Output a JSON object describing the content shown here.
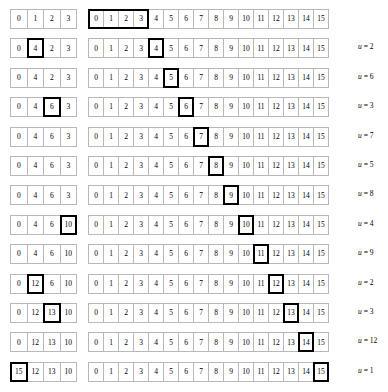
{
  "diagram": {
    "colors": {
      "cell_border": "#b8b8b8",
      "highlight_border": "#000000",
      "background": "#ffffff",
      "text": "#000000"
    },
    "big_array_values": [
      "0",
      "1",
      "2",
      "3",
      "4",
      "5",
      "6",
      "7",
      "8",
      "9",
      "10",
      "11",
      "12",
      "13",
      "14",
      "15"
    ],
    "label_prefix": "u",
    "label_separator": "=",
    "rows": [
      {
        "small_values": [
          "0",
          "1",
          "2",
          "3"
        ],
        "small_highlight": null,
        "small_group": null,
        "big_highlight": null,
        "big_group": [
          0,
          3
        ],
        "label": null
      },
      {
        "small_values": [
          "0",
          "4",
          "2",
          "3"
        ],
        "small_highlight": 1,
        "small_group": null,
        "big_highlight": 4,
        "big_group": null,
        "label": "2"
      },
      {
        "small_values": [
          "0",
          "4",
          "2",
          "3"
        ],
        "small_highlight": null,
        "small_group": null,
        "big_highlight": 5,
        "big_group": null,
        "label": "6"
      },
      {
        "small_values": [
          "0",
          "4",
          "6",
          "3"
        ],
        "small_highlight": 2,
        "small_group": null,
        "big_highlight": 6,
        "big_group": null,
        "label": "3"
      },
      {
        "small_values": [
          "0",
          "4",
          "6",
          "3"
        ],
        "small_highlight": null,
        "small_group": null,
        "big_highlight": 7,
        "big_group": null,
        "label": "7"
      },
      {
        "small_values": [
          "0",
          "4",
          "6",
          "3"
        ],
        "small_highlight": null,
        "small_group": null,
        "big_highlight": 8,
        "big_group": null,
        "label": "5"
      },
      {
        "small_values": [
          "0",
          "4",
          "6",
          "3"
        ],
        "small_highlight": null,
        "small_group": null,
        "big_highlight": 9,
        "big_group": null,
        "label": "8"
      },
      {
        "small_values": [
          "0",
          "4",
          "6",
          "10"
        ],
        "small_highlight": 3,
        "small_group": null,
        "big_highlight": 10,
        "big_group": null,
        "label": "4"
      },
      {
        "small_values": [
          "0",
          "4",
          "6",
          "10"
        ],
        "small_highlight": null,
        "small_group": null,
        "big_highlight": 11,
        "big_group": null,
        "label": "9"
      },
      {
        "small_values": [
          "0",
          "12",
          "6",
          "10"
        ],
        "small_highlight": 1,
        "small_group": null,
        "big_highlight": 12,
        "big_group": null,
        "label": "2"
      },
      {
        "small_values": [
          "0",
          "12",
          "13",
          "10"
        ],
        "small_highlight": 2,
        "small_group": null,
        "big_highlight": 13,
        "big_group": null,
        "label": "3"
      },
      {
        "small_values": [
          "0",
          "12",
          "13",
          "10"
        ],
        "small_highlight": null,
        "small_group": null,
        "big_highlight": 14,
        "big_group": null,
        "label": "12"
      },
      {
        "small_values": [
          "15",
          "12",
          "13",
          "10"
        ],
        "small_highlight": 0,
        "small_group": null,
        "big_highlight": 15,
        "big_group": null,
        "label": "1"
      }
    ]
  }
}
